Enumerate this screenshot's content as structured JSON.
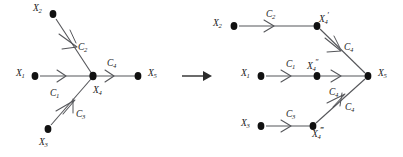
{
  "figure": {
    "type": "graph-transformation-diagram",
    "transform_arrow": "→"
  },
  "colors": {
    "edge": "#55565a",
    "node": "#111111",
    "text": "#1a1a1a",
    "arrow": "#2b2b2b",
    "background": "#ffffff"
  },
  "left_graph": {
    "nodes": [
      {
        "id": "X1",
        "base": "X",
        "sub": "1",
        "prime": "",
        "label_x": 16,
        "label_y": 69,
        "cx": 35,
        "cy": 76
      },
      {
        "id": "X2",
        "base": "X",
        "sub": "2",
        "prime": "",
        "label_x": 33,
        "label_y": 4,
        "cx": 53,
        "cy": 14
      },
      {
        "id": "X3",
        "base": "X",
        "sub": "3",
        "prime": "",
        "label_x": 39,
        "label_y": 138,
        "cx": 48,
        "cy": 129
      },
      {
        "id": "X4",
        "base": "X",
        "sub": "4",
        "prime": "",
        "label_x": 93,
        "label_y": 86,
        "cx": 93,
        "cy": 76
      },
      {
        "id": "X5",
        "base": "X",
        "sub": "5",
        "prime": "",
        "label_x": 148,
        "label_y": 69,
        "cx": 138,
        "cy": 76
      }
    ],
    "edges": [
      {
        "id": "C1",
        "base": "C",
        "sub": "1",
        "from": "X1",
        "to": "X4",
        "label_x": 50,
        "label_y": 89
      },
      {
        "id": "C2",
        "base": "C",
        "sub": "2",
        "from": "X2",
        "to": "X4",
        "label_x": 78,
        "label_y": 43
      },
      {
        "id": "C3",
        "base": "C",
        "sub": "3",
        "from": "X3",
        "to": "X4",
        "label_x": 76,
        "label_y": 110
      },
      {
        "id": "C4",
        "base": "C",
        "sub": "4",
        "from": "X4",
        "to": "X5",
        "label_x": 107,
        "label_y": 59
      }
    ]
  },
  "right_graph": {
    "nodes": [
      {
        "id": "X2r",
        "base": "X",
        "sub": "2",
        "prime": "",
        "label_x": 213,
        "label_y": 19,
        "cx": 234,
        "cy": 26
      },
      {
        "id": "X4p",
        "base": "X",
        "sub": "4",
        "prime": "′",
        "label_x": 319,
        "label_y": 15,
        "cx": 317,
        "cy": 26
      },
      {
        "id": "X1r",
        "base": "X",
        "sub": "1",
        "prime": "",
        "label_x": 241,
        "label_y": 69,
        "cx": 261,
        "cy": 76
      },
      {
        "id": "X4pp",
        "base": "X",
        "sub": "4",
        "prime": "″",
        "label_x": 314,
        "label_y": 62,
        "cx": 317,
        "cy": 76
      },
      {
        "id": "X3r",
        "base": "X",
        "sub": "3",
        "prime": "",
        "label_x": 241,
        "label_y": 119,
        "cx": 261,
        "cy": 126
      },
      {
        "id": "X4ppp",
        "base": "X",
        "sub": "4",
        "prime": "‴",
        "label_x": 314,
        "label_y": 130,
        "cx": 313,
        "cy": 126
      },
      {
        "id": "X5r",
        "base": "X",
        "sub": "5",
        "prime": "",
        "label_x": 378,
        "label_y": 69,
        "cx": 368,
        "cy": 76
      }
    ],
    "edges": [
      {
        "id": "C2r",
        "base": "C",
        "sub": "2",
        "from": "X2r",
        "to": "X4p",
        "label_x": 266,
        "label_y": 10
      },
      {
        "id": "C4top",
        "base": "C",
        "sub": "4",
        "from": "X4p",
        "to": "X5r",
        "label_x": 344,
        "label_y": 43
      },
      {
        "id": "C1r",
        "base": "C",
        "sub": "1",
        "from": "X1r",
        "to": "X4pp",
        "label_x": 286,
        "label_y": 60
      },
      {
        "id": "C4mid",
        "base": "C",
        "sub": "4",
        "from": "X4pp",
        "to": "X5r",
        "label_x": 334,
        "label_y": 88
      },
      {
        "id": "C3r",
        "base": "C",
        "sub": "3",
        "from": "X3r",
        "to": "X4ppp",
        "label_x": 286,
        "label_y": 110
      },
      {
        "id": "C4bot",
        "base": "C",
        "sub": "4",
        "from": "X4ppp",
        "to": "X5r",
        "label_x": 343,
        "label_y": 105
      }
    ]
  }
}
